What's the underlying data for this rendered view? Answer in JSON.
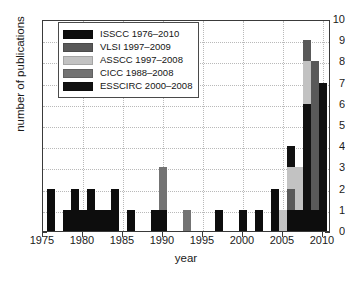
{
  "chart_data": {
    "type": "bar",
    "title": "",
    "xlabel": "year",
    "ylabel": "number of publications",
    "xlim": [
      1975,
      2011
    ],
    "ylim": [
      0,
      10
    ],
    "xticks": [
      1975,
      1980,
      1985,
      1990,
      1995,
      2000,
      2005,
      2010
    ],
    "yticks": [
      0,
      1,
      2,
      3,
      4,
      5,
      6,
      7,
      8,
      9,
      10
    ],
    "grid": true,
    "stacked": true,
    "legend_position": "upper left",
    "series": [
      {
        "name": "ISSCC 1976–2010",
        "color": "#0d0d0d",
        "values": {
          "1976": 2,
          "1978": 1,
          "1979": 2,
          "1980": 1,
          "1981": 2,
          "1982": 1,
          "1983": 1,
          "1984": 2,
          "1986": 1,
          "1989": 1,
          "1990": 1,
          "1997": 1,
          "2000": 1,
          "2002": 1,
          "2004": 2,
          "2006": 1,
          "2007": 1,
          "2008": 1,
          "2009": 1,
          "2010": 1
        }
      },
      {
        "name": "VLSI 1997–2009",
        "color": "#595959",
        "values": {
          "2006": 1,
          "2008": 1,
          "2009": 6
        }
      },
      {
        "name": "ASSCC 1997–2008",
        "color": "#c2c2c2",
        "values": {
          "2005": 1,
          "2006": 1,
          "2007": 2,
          "2008": 2
        }
      },
      {
        "name": "CICC 1988–2008",
        "color": "#737373",
        "values": {
          "1990": 2,
          "1993": 1,
          "2008": 1
        }
      },
      {
        "name": "ESSCIRC 2000–2008",
        "color": "#111111",
        "values": {
          "2006": 1,
          "2008": 5,
          "2010": 6
        }
      }
    ],
    "bars": [
      {
        "year": 1976,
        "total": 2,
        "segments": [
          {
            "series": "ISSCC 1976–2010",
            "value": 2,
            "color": "#0d0d0d"
          }
        ]
      },
      {
        "year": 1978,
        "total": 1,
        "segments": [
          {
            "series": "ISSCC 1976–2010",
            "value": 1,
            "color": "#0d0d0d"
          }
        ]
      },
      {
        "year": 1979,
        "total": 2,
        "segments": [
          {
            "series": "ISSCC 1976–2010",
            "value": 2,
            "color": "#0d0d0d"
          }
        ]
      },
      {
        "year": 1980,
        "total": 1,
        "segments": [
          {
            "series": "ISSCC 1976–2010",
            "value": 1,
            "color": "#0d0d0d"
          }
        ]
      },
      {
        "year": 1981,
        "total": 2,
        "segments": [
          {
            "series": "ISSCC 1976–2010",
            "value": 2,
            "color": "#0d0d0d"
          }
        ]
      },
      {
        "year": 1982,
        "total": 1,
        "segments": [
          {
            "series": "ISSCC 1976–2010",
            "value": 1,
            "color": "#0d0d0d"
          }
        ]
      },
      {
        "year": 1983,
        "total": 1,
        "segments": [
          {
            "series": "ISSCC 1976–2010",
            "value": 1,
            "color": "#0d0d0d"
          }
        ]
      },
      {
        "year": 1984,
        "total": 2,
        "segments": [
          {
            "series": "ISSCC 1976–2010",
            "value": 2,
            "color": "#0d0d0d"
          }
        ]
      },
      {
        "year": 1986,
        "total": 1,
        "segments": [
          {
            "series": "ISSCC 1976–2010",
            "value": 1,
            "color": "#0d0d0d"
          }
        ]
      },
      {
        "year": 1989,
        "total": 1,
        "segments": [
          {
            "series": "ISSCC 1976–2010",
            "value": 1,
            "color": "#0d0d0d"
          }
        ]
      },
      {
        "year": 1990,
        "total": 3,
        "segments": [
          {
            "series": "ISSCC 1976–2010",
            "value": 1,
            "color": "#0d0d0d"
          },
          {
            "series": "CICC 1988–2008",
            "value": 2,
            "color": "#737373"
          }
        ]
      },
      {
        "year": 1993,
        "total": 1,
        "segments": [
          {
            "series": "CICC 1988–2008",
            "value": 1,
            "color": "#737373"
          }
        ]
      },
      {
        "year": 1997,
        "total": 1,
        "segments": [
          {
            "series": "ISSCC 1976–2010",
            "value": 1,
            "color": "#0d0d0d"
          }
        ]
      },
      {
        "year": 2000,
        "total": 1,
        "segments": [
          {
            "series": "ISSCC 1976–2010",
            "value": 1,
            "color": "#0d0d0d"
          }
        ]
      },
      {
        "year": 2002,
        "total": 1,
        "segments": [
          {
            "series": "ISSCC 1976–2010",
            "value": 1,
            "color": "#0d0d0d"
          }
        ]
      },
      {
        "year": 2004,
        "total": 2,
        "segments": [
          {
            "series": "ISSCC 1976–2010",
            "value": 2,
            "color": "#0d0d0d"
          }
        ]
      },
      {
        "year": 2005,
        "total": 1,
        "segments": [
          {
            "series": "ASSCC 1997–2008",
            "value": 1,
            "color": "#c2c2c2"
          }
        ]
      },
      {
        "year": 2006,
        "total": 4,
        "segments": [
          {
            "series": "ISSCC 1976–2010",
            "value": 1,
            "color": "#0d0d0d"
          },
          {
            "series": "VLSI 1997–2009",
            "value": 1,
            "color": "#595959"
          },
          {
            "series": "ASSCC 1997–2008",
            "value": 1,
            "color": "#c2c2c2"
          },
          {
            "series": "ESSCIRC 2000–2008",
            "value": 1,
            "color": "#111111"
          }
        ]
      },
      {
        "year": 2007,
        "total": 3,
        "segments": [
          {
            "series": "ISSCC 1976–2010",
            "value": 1,
            "color": "#0d0d0d"
          },
          {
            "series": "ASSCC 1997–2008",
            "value": 2,
            "color": "#c2c2c2"
          }
        ]
      },
      {
        "year": 2008,
        "total": 9,
        "segments": [
          {
            "series": "ISSCC 1976–2010",
            "value": 1,
            "color": "#0d0d0d"
          },
          {
            "series": "ESSCIRC 2000–2008",
            "value": 5,
            "color": "#111111"
          },
          {
            "series": "ASSCC 1997–2008",
            "value": 2,
            "color": "#c2c2c2"
          },
          {
            "series": "VLSI 1997–2009",
            "value": 1,
            "color": "#595959"
          }
        ]
      },
      {
        "year": 2009,
        "total": 8,
        "segments": [
          {
            "series": "ISSCC 1976–2010",
            "value": 1,
            "color": "#0d0d0d"
          },
          {
            "series": "VLSI 1997–2009",
            "value": 7,
            "color": "#595959"
          }
        ]
      },
      {
        "year": 2010,
        "total": 7,
        "segments": [
          {
            "series": "ISSCC 1976–2010",
            "value": 1,
            "color": "#0d0d0d"
          },
          {
            "series": "ESSCIRC 2000–2008",
            "value": 6,
            "color": "#111111"
          }
        ]
      }
    ]
  },
  "legend": {
    "entries": [
      {
        "label": "ISSCC 1976–2010",
        "color": "#0d0d0d"
      },
      {
        "label": "VLSI 1997–2009",
        "color": "#595959"
      },
      {
        "label": "ASSCC 1997–2008",
        "color": "#c2c2c2"
      },
      {
        "label": "CICC 1988–2008",
        "color": "#737373"
      },
      {
        "label": "ESSCIRC 2000–2008",
        "color": "#111111"
      }
    ]
  },
  "axes": {
    "y_title": "number of publications",
    "x_title": "year",
    "y_tick_labels": [
      "0",
      "1",
      "2",
      "3",
      "4",
      "5",
      "6",
      "7",
      "8",
      "9",
      "10"
    ],
    "x_tick_labels": [
      "1975",
      "1980",
      "1985",
      "1990",
      "1995",
      "2000",
      "2005",
      "2010"
    ]
  }
}
